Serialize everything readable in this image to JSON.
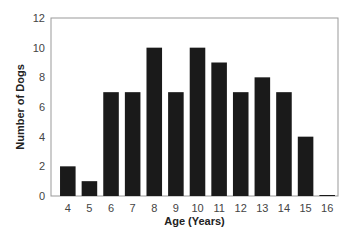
{
  "chart_data": {
    "type": "bar",
    "title": "",
    "xlabel": "Age (Years)",
    "ylabel": "Number of Dogs",
    "categories": [
      "4",
      "5",
      "6",
      "7",
      "8",
      "9",
      "10",
      "11",
      "12",
      "13",
      "14",
      "15",
      "16"
    ],
    "values": [
      2,
      1,
      7,
      7,
      10,
      7,
      10,
      9,
      7,
      8,
      7,
      4,
      0
    ],
    "ylim": [
      0,
      12
    ],
    "yticks": [
      0,
      2,
      4,
      6,
      8,
      10,
      12
    ],
    "grid": false,
    "legend": "none",
    "bar_color": "#1a1a1a",
    "axis_color": "#999999"
  }
}
